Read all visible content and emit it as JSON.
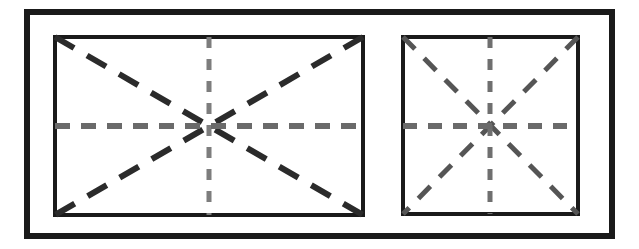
{
  "figure": {
    "canvas": {
      "width": 639,
      "height": 249,
      "background": "#ffffff"
    },
    "outer_frame": {
      "label": "outer-frame",
      "x": 27,
      "y": 12,
      "width": 585,
      "height": 224,
      "stroke": "#1a1a1a",
      "stroke_width": 6,
      "fill": "none"
    },
    "panels": [
      {
        "id": "left-panel",
        "label": "Left rectangular panel",
        "x": 55,
        "y": 37,
        "width": 308,
        "height": 178,
        "stroke": "#1a1a1a",
        "stroke_width": 4,
        "fill": "#ffffff",
        "center_x": 209,
        "center_y": 126,
        "guides": {
          "horizontal": {
            "label": "horizontal-center-line",
            "x1": 55,
            "y1": 126,
            "x2": 363,
            "y2": 126,
            "stroke": "#6a6a6a",
            "stroke_width": 6,
            "dasharray": "15 11"
          },
          "vertical": {
            "label": "vertical-center-line",
            "x1": 209,
            "y1": 37,
            "x2": 209,
            "y2": 215,
            "stroke": "#7d7d7d",
            "stroke_width": 5,
            "dasharray": "11 11"
          },
          "diagonal_tlbr": {
            "label": "diagonal-top-left-to-bottom-right",
            "x1": 55,
            "y1": 37,
            "x2": 363,
            "y2": 215,
            "stroke": "#2b2b2b",
            "stroke_width": 6,
            "dasharray": "22 15"
          },
          "diagonal_trbl": {
            "label": "diagonal-top-right-to-bottom-left",
            "x1": 363,
            "y1": 37,
            "x2": 55,
            "y2": 215,
            "stroke": "#2b2b2b",
            "stroke_width": 6,
            "dasharray": "22 15"
          }
        }
      },
      {
        "id": "right-panel",
        "label": "Right square panel",
        "x": 403,
        "y": 37,
        "width": 175,
        "height": 177,
        "stroke": "#1a1a1a",
        "stroke_width": 4,
        "fill": "#ffffff",
        "center_x": 490,
        "center_y": 126,
        "guides": {
          "horizontal": {
            "label": "horizontal-center-line",
            "x1": 403,
            "y1": 126,
            "x2": 578,
            "y2": 126,
            "stroke": "#6a6a6a",
            "stroke_width": 6,
            "dasharray": "14 11"
          },
          "vertical": {
            "label": "vertical-center-line",
            "x1": 490,
            "y1": 37,
            "x2": 490,
            "y2": 214,
            "stroke": "#6f6f6f",
            "stroke_width": 5,
            "dasharray": "11 11"
          },
          "diagonal_tlbr": {
            "label": "diagonal-top-left-to-bottom-right",
            "x1": 403,
            "y1": 37,
            "x2": 578,
            "y2": 214,
            "stroke": "#555555",
            "stroke_width": 5,
            "dasharray": "17 13"
          },
          "diagonal_trbl": {
            "label": "diagonal-top-right-to-bottom-left",
            "x1": 578,
            "y1": 37,
            "x2": 403,
            "y2": 214,
            "stroke": "#555555",
            "stroke_width": 5,
            "dasharray": "17 13"
          }
        }
      }
    ]
  }
}
